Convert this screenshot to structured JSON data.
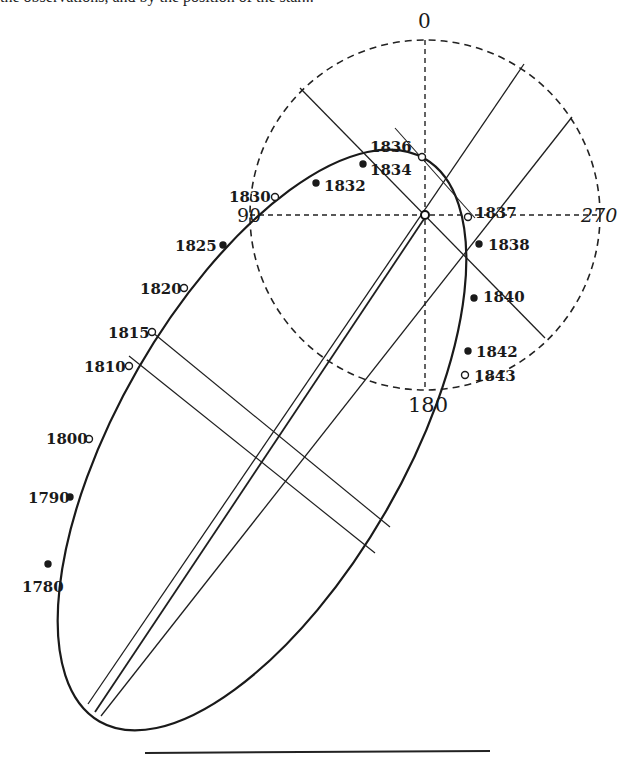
{
  "figure": {
    "top_cut_text": "the observations, and by the position of the star..."
  },
  "circle": {
    "center": [
      425,
      215
    ],
    "radius": 175,
    "labels": {
      "top": "0",
      "left": "90",
      "right": "270",
      "bottom": "180"
    }
  },
  "ellipse": {
    "center": [
      262,
      440
    ],
    "rx": 325,
    "ry": 143,
    "rotation_deg": -60
  },
  "epochs": [
    {
      "label": "1780",
      "x": 48,
      "y": 564,
      "lx": 22,
      "ly": 592,
      "marker": "dot"
    },
    {
      "label": "1790",
      "x": 70,
      "y": 497,
      "lx": 28,
      "ly": 503,
      "marker": "dot"
    },
    {
      "label": "1800",
      "x": 89,
      "y": 439,
      "lx": 46,
      "ly": 444,
      "marker": "open"
    },
    {
      "label": "1810",
      "x": 129,
      "y": 366,
      "lx": 84,
      "ly": 372,
      "marker": "open"
    },
    {
      "label": "1815",
      "x": 152,
      "y": 332,
      "lx": 108,
      "ly": 338,
      "marker": "open"
    },
    {
      "label": "1820",
      "x": 184,
      "y": 288,
      "lx": 140,
      "ly": 294,
      "marker": "open"
    },
    {
      "label": "1825",
      "x": 223,
      "y": 245,
      "lx": 175,
      "ly": 251,
      "marker": "dot"
    },
    {
      "label": "1830",
      "x": 275,
      "y": 197,
      "lx": 229,
      "ly": 202,
      "marker": "open"
    },
    {
      "label": "1832",
      "x": 316,
      "y": 183,
      "lx": 324,
      "ly": 191,
      "marker": "dot"
    },
    {
      "label": "1834",
      "x": 363,
      "y": 164,
      "lx": 370,
      "ly": 175,
      "marker": "dot"
    },
    {
      "label": "1836",
      "x": 422,
      "y": 157,
      "lx": 370,
      "ly": 152,
      "marker": "open"
    },
    {
      "label": "1837",
      "x": 468,
      "y": 217,
      "lx": 475,
      "ly": 218,
      "marker": "open"
    },
    {
      "label": "1838",
      "x": 479,
      "y": 244,
      "lx": 488,
      "ly": 250,
      "marker": "dot"
    },
    {
      "label": "1840",
      "x": 474,
      "y": 298,
      "lx": 483,
      "ly": 302,
      "marker": "dot"
    },
    {
      "label": "1842",
      "x": 468,
      "y": 351,
      "lx": 476,
      "ly": 357,
      "marker": "dot"
    },
    {
      "label": "1843",
      "x": 465,
      "y": 375,
      "lx": 474,
      "ly": 381,
      "marker": "open"
    }
  ],
  "lines": [
    {
      "name": "major-axis-line-a",
      "x1": 88,
      "y1": 704,
      "x2": 524,
      "y2": 64
    },
    {
      "name": "major-axis-line-b",
      "x1": 95,
      "y1": 712,
      "x2": 428,
      "y2": 213
    },
    {
      "name": "major-axis-line-c",
      "x1": 101,
      "y1": 716,
      "x2": 572,
      "y2": 117
    },
    {
      "name": "diameter-line-nw-se",
      "x1": 300,
      "y1": 88,
      "x2": 545,
      "y2": 338
    },
    {
      "name": "short-tangent-line",
      "x1": 395,
      "y1": 128,
      "x2": 475,
      "y2": 218
    },
    {
      "name": "conjugate-line-a",
      "x1": 152,
      "y1": 332,
      "x2": 390,
      "y2": 527
    },
    {
      "name": "conjugate-line-b",
      "x1": 129,
      "y1": 356,
      "x2": 375,
      "y2": 553
    }
  ],
  "rule": {
    "x1": 145,
    "y1": 753,
    "x2": 490,
    "y2": 751
  }
}
